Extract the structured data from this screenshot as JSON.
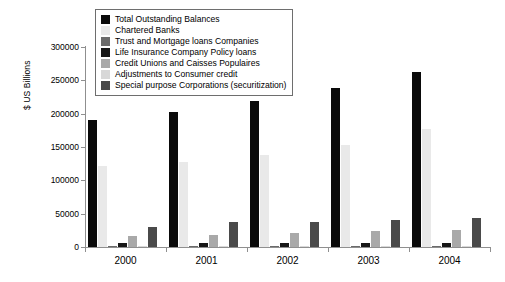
{
  "chart_data": {
    "type": "bar",
    "title": "",
    "xlabel": "",
    "ylabel": "$ US Billions",
    "categories": [
      "2000",
      "2001",
      "2002",
      "2003",
      "2004"
    ],
    "ylim": [
      0,
      300000
    ],
    "yticks": [
      "0",
      "50000",
      "100000",
      "150000",
      "200000",
      "250000",
      "300000"
    ],
    "grid": false,
    "legend_position": "top-center",
    "series": [
      {
        "name": "Total Outstanding Balances",
        "color": "#0a0a0a",
        "values": [
          190000,
          203000,
          219000,
          238000,
          263000
        ]
      },
      {
        "name": "Chartered Banks",
        "color": "#e9e9e9",
        "values": [
          121000,
          128000,
          138000,
          153000,
          177000
        ]
      },
      {
        "name": "Trust and Mortgage loans Companies",
        "color": "#6b6b6b",
        "values": [
          2000,
          2000,
          1500,
          1500,
          1500
        ]
      },
      {
        "name": "Life Insurance Company Policy loans",
        "color": "#171717",
        "values": [
          5500,
          5500,
          6000,
          6000,
          6500
        ]
      },
      {
        "name": "Credit Unions and Caisses Populaires",
        "color": "#a9a9a9",
        "values": [
          16000,
          18000,
          21000,
          24000,
          25000
        ]
      },
      {
        "name": "Adjustments to Consumer credit",
        "color": "#d8d8d8",
        "values": [
          1000,
          1000,
          1000,
          1000,
          1000
        ]
      },
      {
        "name": "Special purpose Corporations (securitization)",
        "color": "#4a4a4a",
        "values": [
          30000,
          37000,
          38000,
          40000,
          44000
        ]
      }
    ]
  }
}
